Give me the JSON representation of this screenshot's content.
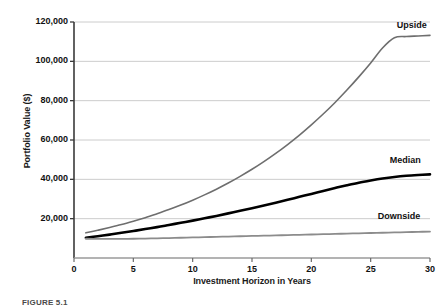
{
  "figure": {
    "caption": "FIGURE 5.1"
  },
  "chart_data": {
    "type": "line",
    "title": "",
    "xlabel": "Investment Horizon in Years",
    "ylabel": "Portfolio Value ($)",
    "xlim": [
      0,
      30
    ],
    "ylim": [
      0,
      120000
    ],
    "grid": true,
    "legend_position": "inline-right-annotations",
    "xticks": [
      0,
      5,
      10,
      15,
      20,
      25,
      30
    ],
    "xtick_labels": [
      "0",
      "5",
      "10",
      "15",
      "20",
      "25",
      "30"
    ],
    "yticks": [
      20000,
      40000,
      60000,
      80000,
      100000,
      120000
    ],
    "ytick_labels": [
      "20,000",
      "40,000",
      "60,000",
      "80,000",
      "100,000",
      "120,000"
    ],
    "x": [
      1,
      2,
      3,
      4,
      5,
      6,
      7,
      8,
      9,
      10,
      11,
      12,
      13,
      14,
      15,
      16,
      17,
      18,
      19,
      20,
      21,
      22,
      23,
      24,
      25,
      26,
      27,
      28,
      29,
      30
    ],
    "series": [
      {
        "name": "Upside",
        "color": "#6e6e6e",
        "width": 1.6,
        "label_x": 27.2,
        "label_y": 118000,
        "values": [
          12800,
          14100,
          15500,
          17000,
          18700,
          20500,
          22500,
          24600,
          26900,
          29400,
          32100,
          35000,
          38100,
          41500,
          45100,
          49000,
          53200,
          57700,
          62500,
          67700,
          73200,
          79100,
          85400,
          92100,
          99200,
          106800,
          112000,
          112600,
          112900,
          113200
        ]
      },
      {
        "name": "Median",
        "color": "#000000",
        "width": 2.6,
        "label_x": 26.6,
        "label_y": 49500,
        "values": [
          10300,
          11100,
          11900,
          12800,
          13700,
          14700,
          15700,
          16800,
          17900,
          19000,
          20200,
          21400,
          22700,
          24000,
          25300,
          26700,
          28100,
          29600,
          31100,
          32600,
          34100,
          35600,
          37000,
          38300,
          39400,
          40400,
          41200,
          41800,
          42200,
          42500
        ]
      },
      {
        "name": "Downside",
        "color": "#8c8c8c",
        "width": 1.8,
        "label_x": 25.6,
        "label_y": 21000,
        "values": [
          9800,
          9700,
          9700,
          9700,
          9800,
          9900,
          10000,
          10150,
          10300,
          10450,
          10600,
          10750,
          10900,
          11050,
          11200,
          11350,
          11500,
          11650,
          11800,
          11950,
          12100,
          12250,
          12400,
          12550,
          12700,
          12850,
          13000,
          13150,
          13300,
          13450
        ]
      }
    ],
    "style": {
      "grid_color": "#cccccc",
      "axis_color": "#3a3a3a",
      "background": "#ffffff"
    }
  }
}
